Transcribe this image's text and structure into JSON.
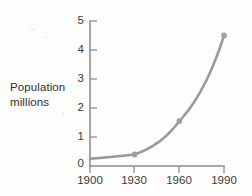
{
  "chart_data": {
    "type": "line",
    "title": "",
    "xlabel": "",
    "ylabel": "Population millions",
    "x": [
      1900,
      1930,
      1960,
      1990
    ],
    "values": [
      0.25,
      0.4,
      1.55,
      4.5
    ],
    "series": [
      {
        "name": "Population",
        "values": [
          0.25,
          0.4,
          1.55,
          4.5
        ]
      }
    ],
    "xlim": [
      1900,
      1990
    ],
    "ylim": [
      0,
      5
    ],
    "xticks": [
      "1900",
      "1930",
      "1960",
      "1990"
    ],
    "yticks": [
      "0",
      "1",
      "2",
      "3",
      "4",
      "5"
    ],
    "grid": false,
    "legend": false,
    "marker_years": [
      1930,
      1960,
      1990
    ],
    "line_color": "#9a9a9a",
    "marker_color": "#a0a0a0",
    "axis_color": "#8e8e8e",
    "text_color": "#2e2e2e"
  },
  "axis_title": {
    "line1": "Population",
    "line2": "millions"
  },
  "yticks": {
    "t0": "0",
    "t1": "1",
    "t2": "2",
    "t3": "3",
    "t4": "4",
    "t5": "5"
  },
  "xticks": {
    "t0": "1900",
    "t1": "1930",
    "t2": "1960",
    "t3": "1990"
  }
}
